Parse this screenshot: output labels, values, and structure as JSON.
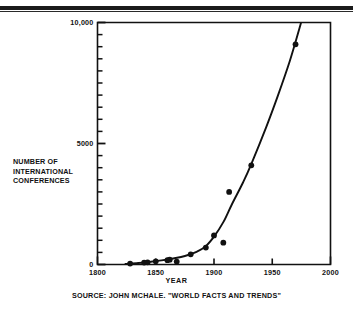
{
  "figure": {
    "source_caption": "SOURCE: JOHN MCHALE. \"WORLD FACTS AND TRENDS\"",
    "frame_color": "#111111",
    "background_color": "#ffffff"
  },
  "chart_data": {
    "type": "scatter",
    "title": "",
    "subtitle": "",
    "xlabel": "YEAR",
    "ylabel": "NUMBER OF INTERNATIONAL CONFERENCES",
    "ylabel_lines": [
      "NUMBER OF",
      "INTERNATIONAL",
      "CONFERENCES"
    ],
    "xlim": [
      1800,
      2000
    ],
    "ylim": [
      0,
      10000
    ],
    "grid": false,
    "legend": "none",
    "xticks": [
      1800,
      1850,
      1900,
      1950,
      2000
    ],
    "xtick_labels": [
      "1800",
      "1850",
      "1900",
      "1950",
      "2000"
    ],
    "yticks": [
      0,
      5000,
      10000
    ],
    "ytick_labels": [
      "0",
      "5000",
      "10,000"
    ],
    "y_minor_tick_interval": 500,
    "series": [
      {
        "name": "International conferences",
        "marker": "filled-circle",
        "color": "#111111",
        "points": [
          {
            "x": 1828,
            "y": 40
          },
          {
            "x": 1840,
            "y": 80
          },
          {
            "x": 1843,
            "y": 90
          },
          {
            "x": 1850,
            "y": 130
          },
          {
            "x": 1860,
            "y": 180
          },
          {
            "x": 1862,
            "y": 200
          },
          {
            "x": 1868,
            "y": 120
          },
          {
            "x": 1880,
            "y": 420
          },
          {
            "x": 1893,
            "y": 700
          },
          {
            "x": 1900,
            "y": 1200
          },
          {
            "x": 1908,
            "y": 900
          },
          {
            "x": 1913,
            "y": 3000
          },
          {
            "x": 1932,
            "y": 4100
          },
          {
            "x": 1970,
            "y": 9100
          }
        ]
      }
    ],
    "trend_curve": {
      "name": "Fitted exponential growth curve",
      "color": "#111111",
      "points": [
        {
          "x": 1824,
          "y": 20
        },
        {
          "x": 1835,
          "y": 60
        },
        {
          "x": 1845,
          "y": 110
        },
        {
          "x": 1855,
          "y": 170
        },
        {
          "x": 1865,
          "y": 250
        },
        {
          "x": 1875,
          "y": 350
        },
        {
          "x": 1885,
          "y": 520
        },
        {
          "x": 1893,
          "y": 760
        },
        {
          "x": 1900,
          "y": 1150
        },
        {
          "x": 1908,
          "y": 1750
        },
        {
          "x": 1915,
          "y": 2450
        },
        {
          "x": 1925,
          "y": 3400
        },
        {
          "x": 1932,
          "y": 4150
        },
        {
          "x": 1945,
          "y": 5700
        },
        {
          "x": 1955,
          "y": 7000
        },
        {
          "x": 1965,
          "y": 8400
        },
        {
          "x": 1973,
          "y": 9700
        },
        {
          "x": 1977,
          "y": 10400
        }
      ]
    }
  }
}
